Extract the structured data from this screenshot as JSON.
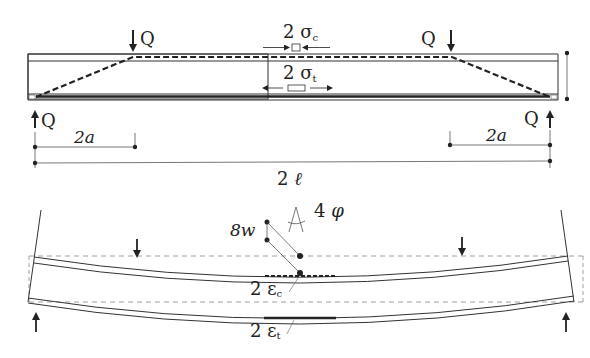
{
  "colors": {
    "line": "#333333",
    "dashed": "#222222",
    "ref_dashed": "#888888",
    "background": "#ffffff"
  },
  "top_view": {
    "load_left_top": "Q",
    "load_right_top": "Q",
    "reaction_left": "Q",
    "reaction_right": "Q",
    "stress_compression": {
      "coef": "2",
      "symbol": "σ",
      "sub": "c"
    },
    "stress_tension": {
      "coef": "2",
      "symbol": "σ",
      "sub": "t"
    },
    "dim_left": "2a",
    "dim_right": "2a",
    "dim_total": "2 ℓ"
  },
  "bottom_view": {
    "deflection": "8w",
    "rotation": "4 φ",
    "strain_compression": {
      "coef": "2",
      "symbol": "ε",
      "sub": "c"
    },
    "strain_tension": {
      "coef": "2",
      "symbol": "ε",
      "sub": "t"
    }
  }
}
